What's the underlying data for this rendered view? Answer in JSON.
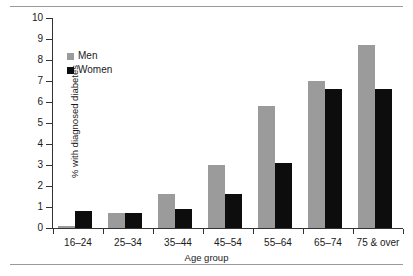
{
  "chart_data": {
    "type": "bar",
    "title": "",
    "xlabel": "Age group",
    "ylabel": "% with diagnosed diabetes",
    "ylim": [
      0,
      10
    ],
    "ytick_labels": [
      "0",
      "1",
      "2",
      "3",
      "4",
      "5",
      "6",
      "7",
      "8",
      "9",
      "10"
    ],
    "yticks": [
      0,
      1,
      2,
      3,
      4,
      5,
      6,
      7,
      8,
      9,
      10
    ],
    "grid": false,
    "legend_position": "upper-left-inside",
    "categories": [
      "16–24",
      "25–34",
      "35–44",
      "45–54",
      "55–64",
      "65–74",
      "75 & over"
    ],
    "series": [
      {
        "name": "Men",
        "color": "#9b9b9b",
        "values": [
          0.1,
          0.7,
          1.6,
          3.0,
          5.8,
          7.0,
          8.7
        ]
      },
      {
        "name": "Women",
        "color": "#0d0d0d",
        "values": [
          0.8,
          0.7,
          0.9,
          1.6,
          3.1,
          6.6,
          6.6
        ]
      }
    ]
  },
  "legend": {
    "items": [
      {
        "label": "Men"
      },
      {
        "label": "Women"
      }
    ]
  },
  "colors": {
    "men": "#9b9b9b",
    "women": "#0d0d0d",
    "axis": "#333333",
    "rule": "#9a9a9a",
    "background": "#ffffff"
  }
}
